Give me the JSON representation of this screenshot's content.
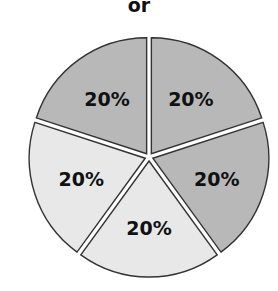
{
  "header": {
    "title": "or"
  },
  "chart_data": {
    "type": "pie",
    "title": "or",
    "categories": [
      "Slice 1",
      "Slice 2",
      "Slice 3",
      "Slice 4",
      "Slice 5"
    ],
    "values": [
      20,
      20,
      20,
      20,
      20
    ],
    "labels": [
      "20%",
      "20%",
      "20%",
      "20%",
      "20%"
    ],
    "colors": [
      "#b8b8b8",
      "#b8b8b8",
      "#e8e8e8",
      "#e8e8e8",
      "#b8b8b8"
    ],
    "exploded": true,
    "legend": null
  },
  "colors": {
    "dark_fill": "#b8b8b8",
    "light_fill": "#e8e8e8",
    "outline": "#333333"
  }
}
